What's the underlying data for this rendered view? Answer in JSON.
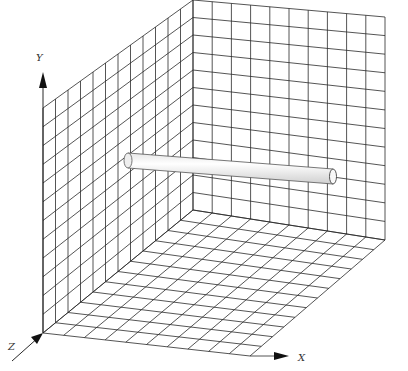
{
  "diagram": {
    "type": "3d-grid-room",
    "colors": {
      "grid_line": "#2a2a2a",
      "background": "#ffffff",
      "cylinder_fill": "#f4f4f4",
      "cylinder_shade": "#d8d8d8",
      "axis": "#111111"
    },
    "axes": {
      "x": {
        "label": "X"
      },
      "y": {
        "label": "Y"
      },
      "z": {
        "label": "Z"
      }
    },
    "grid": {
      "left_wall": {
        "columns": 12,
        "rows": 12
      },
      "back_wall": {
        "columns": 10,
        "rows": 12
      },
      "floor": {
        "columns": 10,
        "rows": 12
      }
    },
    "object": {
      "name": "cylinder",
      "orientation": "parallel to X axis"
    }
  }
}
